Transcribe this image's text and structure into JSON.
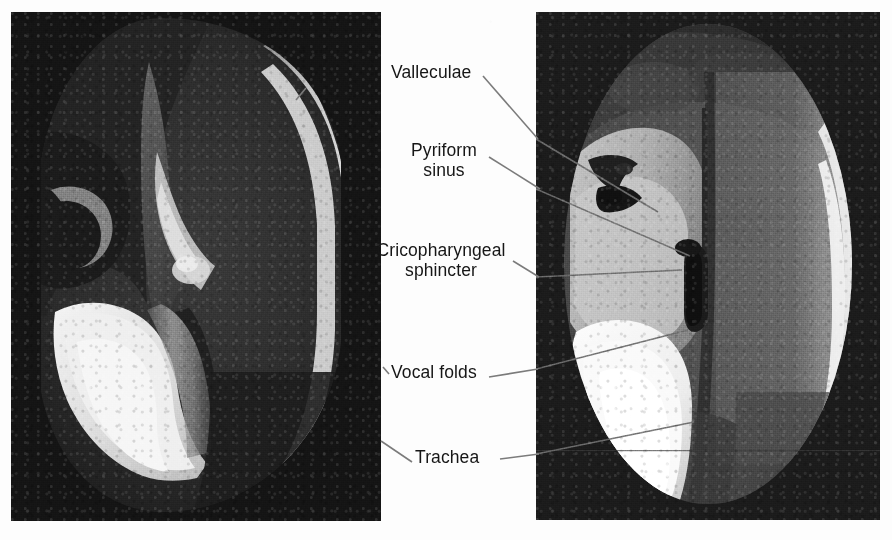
{
  "figure": {
    "kind": "annotated-radiograph-pair",
    "background_color": "#fdfdfd",
    "panel_background_color": "#121212",
    "leader_line_color": "#7b7b7b",
    "label_text_color": "#161616"
  },
  "panels": [
    {
      "id": "left",
      "name": "lateral-view-radiograph",
      "alt": "Lateral fluoroscopic view of the pharynx and larynx",
      "x": 11,
      "y": 12,
      "width": 370,
      "height": 509
    },
    {
      "id": "right",
      "name": "anteroposterior-view-radiograph",
      "alt": "Anteroposterior fluoroscopic view of the pharynx and larynx",
      "x": 536,
      "y": 12,
      "width": 344,
      "height": 508
    }
  ],
  "labels": [
    {
      "id": "valleculae",
      "text": "Valleculae",
      "lines": [
        "Valleculae"
      ],
      "x": 391,
      "y": 62,
      "align": "left"
    },
    {
      "id": "pyriform",
      "text": "Pyriform sinus",
      "lines": [
        "Pyriform",
        "sinus"
      ],
      "x": 398,
      "y": 140,
      "align": "center",
      "boxWidth": 92
    },
    {
      "id": "cricopharyngeal",
      "text": "Cricopharyngeal sphincter",
      "lines": [
        "Cricopharyngeal",
        "sphincter"
      ],
      "x": 372,
      "y": 240,
      "align": "center",
      "boxWidth": 138
    },
    {
      "id": "vocalfolds",
      "text": "Vocal folds",
      "lines": [
        "Vocal folds"
      ],
      "x": 391,
      "y": 362,
      "align": "left"
    },
    {
      "id": "trachea",
      "text": "Trachea",
      "lines": [
        "Trachea"
      ],
      "x": 415,
      "y": 447,
      "align": "left"
    }
  ],
  "leader_lines": [
    {
      "id": "valleculae-left",
      "label": "valleculae",
      "points": "306,88 296,100"
    },
    {
      "id": "valleculae-right",
      "label": "valleculae",
      "points": "483,76 538,139"
    },
    {
      "id": "pyriform-left",
      "label": "pyriform",
      "points": "355,125 198,216"
    },
    {
      "id": "pyriform-right",
      "label": "pyriform",
      "points": "489,157 540,189"
    },
    {
      "id": "pyriform-left-2",
      "label": "pyriform",
      "points": "355,171 269,205"
    },
    {
      "id": "cricopharyngeal-left",
      "label": "cricopharyngeal",
      "points": "355,206 238,262"
    },
    {
      "id": "cricopharyngeal-right",
      "label": "cricopharyngeal",
      "points": "513,261 539,277"
    },
    {
      "id": "vocalfolds-left",
      "label": "vocalfolds",
      "points": "383,367 389,374"
    },
    {
      "id": "vocalfolds-right",
      "label": "vocalfolds",
      "points": "489,377 538,369"
    },
    {
      "id": "trachea-left",
      "label": "trachea",
      "points": "381,441 412,462"
    },
    {
      "id": "trachea-right",
      "label": "trachea",
      "points": "500,459 539,454"
    }
  ]
}
